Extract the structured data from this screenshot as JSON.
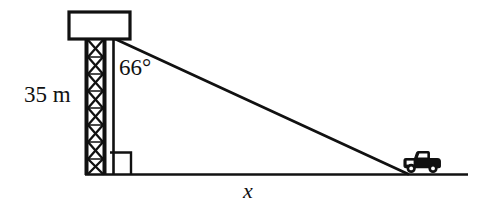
{
  "figure": {
    "background_color": "#ffffff",
    "stroke_color": "#111111"
  },
  "labels": {
    "height": "35 m",
    "angle": "66°",
    "base": "x"
  },
  "elements": {
    "tower_cabin": "tower-top-cabin",
    "tower_lattice": "lattice-tower-mast",
    "vertical_side": "vertical-height-line",
    "hypotenuse": "line-of-sight-hypotenuse",
    "right_angle_marker": "right-angle-square",
    "ground_line": "ground-baseline",
    "car": "car-icon"
  },
  "geometry": {
    "tower_top_y": 38,
    "ground_y": 174,
    "vertical_x": 113,
    "car_ground_x": 408,
    "baseline_start_x": 85,
    "baseline_end_x": 468,
    "angle_degrees": 66,
    "height_meters": 35,
    "unknown": "x"
  }
}
